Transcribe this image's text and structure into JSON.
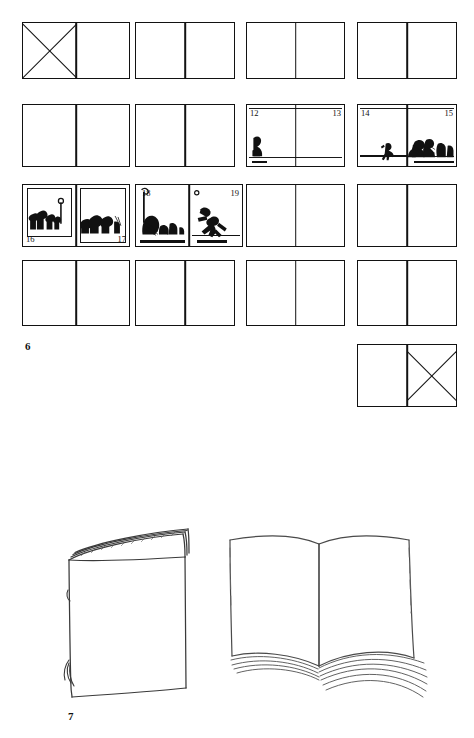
{
  "page": {
    "background": "#ffffff",
    "ink": "#111111",
    "width": 474,
    "height": 738
  },
  "figures": [
    {
      "id": "figure-6",
      "caption_number": "6",
      "type": "storyboard-grid",
      "description": "Grid of blank two-page book spreads, four columns by four rows, plus one extra spread below; four spreads contain drawn artwork with page numbers.",
      "columns": 4,
      "rows": 4,
      "spreads": [
        {
          "index": 1,
          "row": 1,
          "col": 1,
          "state": "crossed-left",
          "pages": []
        },
        {
          "index": 2,
          "row": 1,
          "col": 2,
          "state": "blank",
          "pages": []
        },
        {
          "index": 3,
          "row": 1,
          "col": 3,
          "state": "blank",
          "pages": []
        },
        {
          "index": 4,
          "row": 1,
          "col": 4,
          "state": "blank",
          "pages": []
        },
        {
          "index": 5,
          "row": 2,
          "col": 1,
          "state": "blank",
          "pages": []
        },
        {
          "index": 6,
          "row": 2,
          "col": 2,
          "state": "blank",
          "pages": []
        },
        {
          "index": 7,
          "row": 2,
          "col": 3,
          "state": "drawn",
          "pages": [
            "12",
            "13"
          ],
          "page_label_positions": [
            "top-left",
            "top-right"
          ],
          "art": "lone standing figure at left edge on a ground line"
        },
        {
          "index": 8,
          "row": 2,
          "col": 4,
          "state": "drawn",
          "pages": [
            "14",
            "15"
          ],
          "page_label_positions": [
            "top-left",
            "top-right"
          ],
          "art": "small running figure on left page, crouching group on right page"
        },
        {
          "index": 9,
          "row": 3,
          "col": 1,
          "state": "drawn",
          "pages": [
            "16",
            "17"
          ],
          "page_label_positions": [
            "bottom-left",
            "bottom-right"
          ],
          "art": "row of standing figures inside a drawn frame on left page, cluster of figures on right page"
        },
        {
          "index": 10,
          "row": 3,
          "col": 2,
          "state": "drawn",
          "pages": [
            "18",
            "19"
          ],
          "page_label_positions": [
            "top-left",
            "top-right"
          ],
          "art": "seated group beside a vertical pole on left page, figure hurling an object on right page"
        },
        {
          "index": 11,
          "row": 3,
          "col": 3,
          "state": "blank",
          "pages": []
        },
        {
          "index": 12,
          "row": 3,
          "col": 4,
          "state": "blank",
          "pages": []
        },
        {
          "index": 13,
          "row": 4,
          "col": 1,
          "state": "blank",
          "pages": []
        },
        {
          "index": 14,
          "row": 4,
          "col": 2,
          "state": "blank",
          "pages": []
        },
        {
          "index": 15,
          "row": 4,
          "col": 3,
          "state": "blank",
          "pages": []
        },
        {
          "index": 16,
          "row": 4,
          "col": 4,
          "state": "blank",
          "pages": []
        },
        {
          "index": 17,
          "row": 5,
          "col": 4,
          "state": "crossed-right",
          "pages": []
        }
      ]
    },
    {
      "id": "figure-7",
      "caption_number": "7",
      "type": "book-illustration",
      "items": [
        {
          "name": "closed-book",
          "description": "Hand-drawn closed book standing upright, cover facing viewer, page edges visible at top"
        },
        {
          "name": "open-book",
          "description": "Hand-drawn open book seen from above with pages fanning out on both sides"
        }
      ]
    }
  ]
}
